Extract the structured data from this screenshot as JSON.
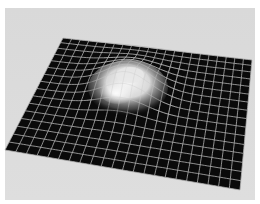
{
  "image": {
    "description": "Rendered grayscale illustration of a dark gridded plane with a smooth white bump rising near its center",
    "subject": "gravity-well style mesh with raised bump",
    "colors": {
      "page_background": "#ffffff",
      "backdrop": "#d6d6d6",
      "plane": "#0a0a0a",
      "grid_lines": "#b4b4b4",
      "bump_highlight": "#f4f4f4"
    },
    "grid": {
      "columns": 22,
      "rows": 16
    }
  }
}
